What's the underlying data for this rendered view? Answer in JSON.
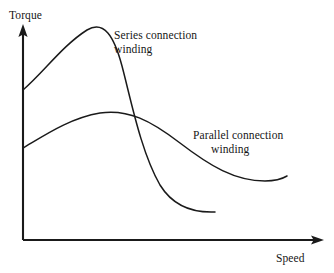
{
  "figure": {
    "background_color": "#ffffff",
    "stroke_color": "#1a1a1a",
    "width": 334,
    "height": 273
  },
  "axes": {
    "y_label": "Torque",
    "x_label": "Speed",
    "origin": {
      "x": 23,
      "y": 240
    },
    "y_axis_top": 26,
    "x_axis_right": 323,
    "arrow_heads": true,
    "ticks": false,
    "grid": false
  },
  "annotations": [
    {
      "id": "series",
      "line1": "Series connection",
      "line2": "winding"
    },
    {
      "id": "parallel",
      "line1": "Parallel connection",
      "line2": "winding"
    }
  ],
  "chart_data": {
    "type": "line",
    "title": "",
    "xlabel": "Speed",
    "ylabel": "Torque",
    "xlim": [
      0,
      300
    ],
    "ylim": [
      0,
      214
    ],
    "grid": false,
    "ticks_shown": false,
    "legend": "inline-annotations",
    "legend_position": "inline",
    "axis_note": "Qualitative torque-speed characteristic curves; axes unscaled with arrow heads",
    "series": [
      {
        "name": "Series connection winding",
        "label_line1": "Series connection",
        "label_line2": "winding",
        "path": "M 23 90 C 44 72, 62 46, 87 30 C 104 20, 114 36, 122 66 C 131 100, 141 152, 160 185 C 173 206, 192 213, 215 212",
        "points": [
          {
            "x": 0,
            "y": 150
          },
          {
            "x": 64,
            "y": 210
          },
          {
            "x": 91,
            "y": 196
          },
          {
            "x": 110,
            "y": 150
          },
          {
            "x": 137,
            "y": 88
          },
          {
            "x": 157,
            "y": 48
          },
          {
            "x": 192,
            "y": 28
          }
        ],
        "description": "Starts at moderate torque on axis, rises to a sharp peak at low speed, then falls steeply and flattens out at low torque at high speed"
      },
      {
        "name": "Parallel connection winding",
        "label_line1": "Parallel connection",
        "label_line2": "winding",
        "path": "M 23 148 C 45 135, 70 118, 100 113 C 128 109, 150 120, 180 143 C 210 166, 235 181, 265 181 C 274 181, 282 179, 287 176",
        "points": [
          {
            "x": 0,
            "y": 92
          },
          {
            "x": 40,
            "y": 117
          },
          {
            "x": 77,
            "y": 128
          },
          {
            "x": 110,
            "y": 122
          },
          {
            "x": 157,
            "y": 97
          },
          {
            "x": 212,
            "y": 72
          },
          {
            "x": 242,
            "y": 59
          },
          {
            "x": 264,
            "y": 64
          }
        ],
        "description": "Starts lower on axis, rises gently to a broad plateau, then decreases gradually to a shallow minimum at high speed"
      }
    ],
    "intersection": {
      "x": 114,
      "y": 117,
      "note": "The two curves cross once at moderate speed"
    }
  }
}
